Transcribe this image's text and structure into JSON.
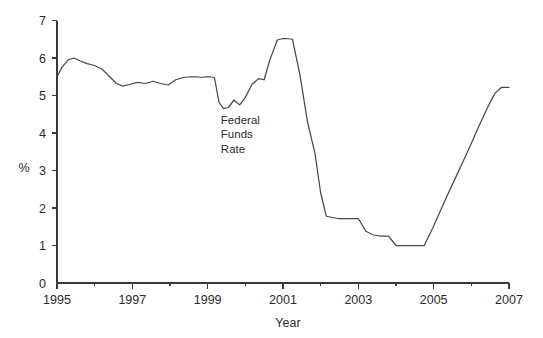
{
  "chart_data": {
    "type": "line",
    "title": "",
    "subtitle": "",
    "xlabel": "Year",
    "ylabel": "%",
    "xlim": [
      1995,
      2007
    ],
    "ylim": [
      0,
      7
    ],
    "grid": false,
    "legend": "none",
    "xticks": [
      1995,
      1997,
      1999,
      2001,
      2003,
      2005,
      2007
    ],
    "xtick_labels": [
      "1995",
      "1997",
      "1999",
      "2001",
      "2003",
      "2005",
      "2007"
    ],
    "xminor_ticks": [
      1996,
      1998,
      2000,
      2002,
      2004,
      2006
    ],
    "yticks": [
      0,
      1,
      2,
      3,
      4,
      5,
      6,
      7
    ],
    "ytick_labels": [
      "0",
      "1",
      "2",
      "3",
      "4",
      "5",
      "6",
      "7"
    ],
    "annotations": [
      {
        "name": "series-label",
        "lines": [
          "Federal",
          "Funds",
          "Rate"
        ],
        "x": 1999.35,
        "y": 4.25
      }
    ],
    "series": [
      {
        "name": "Federal Funds Rate",
        "color": "#4a4a4a",
        "x": [
          1995.0,
          1995.13,
          1995.3,
          1995.45,
          1995.62,
          1995.8,
          1996.0,
          1996.2,
          1996.4,
          1996.58,
          1996.75,
          1996.95,
          1997.15,
          1997.35,
          1997.55,
          1997.75,
          1997.95,
          1998.15,
          1998.35,
          1998.55,
          1998.72,
          1998.85,
          1998.95,
          1999.05,
          1999.18,
          1999.3,
          1999.42,
          1999.55,
          1999.7,
          1999.85,
          2000.0,
          2000.18,
          2000.35,
          2000.5,
          2000.65,
          2000.85,
          2001.0,
          2001.08,
          2001.25,
          2001.45,
          2001.65,
          2001.85,
          2002.0,
          2002.15,
          2002.45,
          2002.7,
          2002.85,
          2003.0,
          2003.2,
          2003.4,
          2003.6,
          2003.8,
          2004.0,
          2004.3,
          2004.55,
          2004.75,
          2005.0,
          2005.3,
          2005.6,
          2005.9,
          2006.2,
          2006.45,
          2006.62,
          2006.8,
          2007.0
        ],
        "y": [
          5.5,
          5.75,
          5.95,
          6.0,
          5.92,
          5.85,
          5.8,
          5.7,
          5.5,
          5.32,
          5.25,
          5.3,
          5.35,
          5.32,
          5.38,
          5.32,
          5.28,
          5.42,
          5.48,
          5.5,
          5.5,
          5.48,
          5.5,
          5.5,
          5.48,
          4.82,
          4.65,
          4.68,
          4.88,
          4.75,
          4.95,
          5.3,
          5.45,
          5.42,
          5.95,
          6.48,
          6.52,
          6.52,
          6.5,
          5.55,
          4.3,
          3.45,
          2.4,
          1.78,
          1.72,
          1.72,
          1.72,
          1.72,
          1.38,
          1.28,
          1.25,
          1.25,
          1.0,
          1.0,
          1.0,
          1.0,
          1.52,
          2.2,
          2.85,
          3.5,
          4.18,
          4.72,
          5.05,
          5.22,
          5.22
        ]
      }
    ]
  },
  "annotation_lines": {
    "line1": "Federal",
    "line2": "Funds",
    "line3": "Rate"
  },
  "axis": {
    "y_title": "%",
    "x_title": "Year"
  }
}
